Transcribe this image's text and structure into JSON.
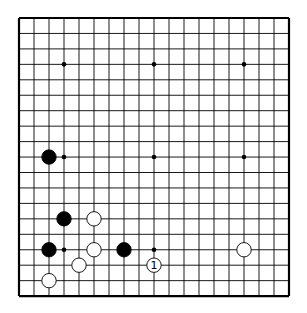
{
  "board": {
    "size": 19,
    "origin": {
      "x": 19,
      "y": 18
    },
    "spacing": {
      "x": 15,
      "y": 15.45
    },
    "line_color": "#000000",
    "background": "#ffffff"
  },
  "star_points": [
    [
      3,
      3
    ],
    [
      9,
      3
    ],
    [
      15,
      3
    ],
    [
      3,
      9
    ],
    [
      9,
      9
    ],
    [
      15,
      9
    ],
    [
      3,
      15
    ],
    [
      9,
      15
    ],
    [
      15,
      15
    ]
  ],
  "stones": [
    {
      "color": "black",
      "col": 2,
      "row": 9
    },
    {
      "color": "black",
      "col": 3,
      "row": 13
    },
    {
      "color": "white",
      "col": 5,
      "row": 13
    },
    {
      "color": "black",
      "col": 2,
      "row": 15
    },
    {
      "color": "white",
      "col": 5,
      "row": 15
    },
    {
      "color": "black",
      "col": 7,
      "row": 15
    },
    {
      "color": "white",
      "col": 4,
      "row": 16
    },
    {
      "color": "white",
      "col": 2,
      "row": 17
    },
    {
      "color": "white",
      "col": 9,
      "row": 16,
      "label": "1"
    },
    {
      "color": "white",
      "col": 15,
      "row": 15
    }
  ]
}
